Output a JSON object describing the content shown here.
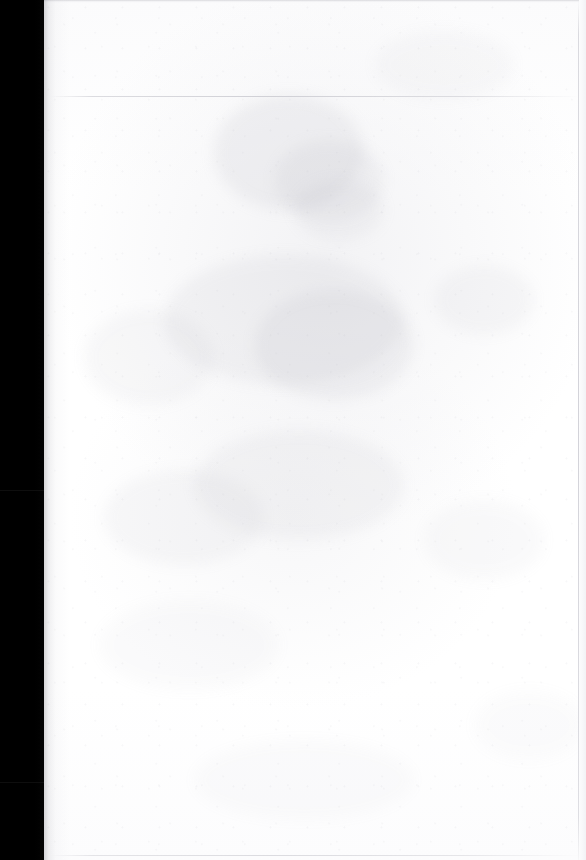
{
  "document": {
    "kind": "scanned-page",
    "page_state": "blank",
    "visible_text": "",
    "caption": "Blank scanned page",
    "width_px": 586,
    "height_px": 860
  },
  "colors": {
    "scanner_bed": "#000000",
    "paper_white": "#fdfdfd",
    "paper_tint": "#f4f4f6",
    "gutter_shadow": "#787880",
    "seam_line": "#cecedg",
    "bleed_ink": "#b0b0ba"
  },
  "regions": {
    "scanner_bed": {
      "name": "scanner-bed",
      "x": 0,
      "y": 0,
      "width": 44,
      "height": 860,
      "seams": [
        {
          "name": "bed-seam-mid",
          "y": 490
        },
        {
          "name": "bed-seam-low",
          "y": 782
        }
      ]
    },
    "page_sheet": {
      "name": "page-sheet",
      "x": 44,
      "y": 0,
      "width": 542,
      "height": 860,
      "gutter_shadow_width": 26,
      "rules": [
        {
          "name": "rule-top",
          "y": 96
        },
        {
          "name": "rule-bottom",
          "y": 855
        }
      ],
      "edge_line_x": 578
    }
  },
  "bleed_through": {
    "description": "faint ink show-through from the reverse side",
    "legible": false,
    "concentration": "upper-middle and mid-left of the sheet"
  }
}
